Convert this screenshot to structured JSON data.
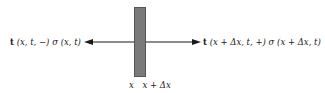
{
  "diagram": {
    "left_label": {
      "vector": "t",
      "args": "(x, t, −)",
      "sigma": "σ",
      "sigma_args": "(x, t)"
    },
    "right_label": {
      "vector": "t",
      "args": "(x + Δx, t, +)",
      "sigma": "σ",
      "sigma_args": "(x + Δx, t)"
    },
    "bottom_labels": [
      "x",
      "x + Δx"
    ],
    "colors": {
      "bar": "#7a7a7a",
      "arrow": "#1a1a1a"
    }
  }
}
